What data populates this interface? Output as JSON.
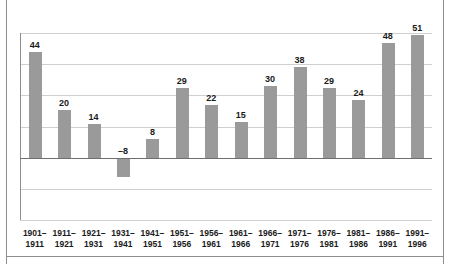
{
  "chart_data": {
    "type": "bar",
    "title": "",
    "subtitle": "",
    "xlabel": "",
    "ylabel": "",
    "ylim": [
      -26,
      52
    ],
    "grid": true,
    "legend": false,
    "gridlines": [
      52,
      39,
      26,
      13,
      0,
      -13,
      -26
    ],
    "zero_baseline": 0,
    "categories": [
      "1901–\n1911",
      "1911–\n1921",
      "1921–\n1931",
      "1931–\n1941",
      "1941–\n1951",
      "1951–\n1956",
      "1956–\n1961",
      "1961–\n1966",
      "1966–\n1971",
      "1971–\n1976",
      "1976–\n1981",
      "1981–\n1986",
      "1986–\n1991",
      "1991–\n1996"
    ],
    "category_lines": [
      [
        "1901–",
        "1911"
      ],
      [
        "1911–",
        "1921"
      ],
      [
        "1921–",
        "1931"
      ],
      [
        "1931–",
        "1941"
      ],
      [
        "1941–",
        "1951"
      ],
      [
        "1951–",
        "1956"
      ],
      [
        "1956–",
        "1961"
      ],
      [
        "1961–",
        "1966"
      ],
      [
        "1966–",
        "1971"
      ],
      [
        "1971–",
        "1976"
      ],
      [
        "1976–",
        "1981"
      ],
      [
        "1981–",
        "1986"
      ],
      [
        "1986–",
        "1991"
      ],
      [
        "1991–",
        "1996"
      ]
    ],
    "values": [
      44,
      20,
      14,
      -8,
      8,
      29,
      22,
      15,
      30,
      38,
      29,
      24,
      48,
      51
    ],
    "value_labels": [
      "44",
      "20",
      "14",
      "–8",
      "8",
      "29",
      "22",
      "15",
      "30",
      "38",
      "29",
      "24",
      "48",
      "51"
    ],
    "colors": {
      "bar": "#9a9a9a",
      "gridline": "#cfcfcf",
      "axis": "#8d8d8d",
      "zero_line": "#6e6e6e",
      "label_text": "#1a1a1a",
      "background": "#ffffff"
    }
  }
}
